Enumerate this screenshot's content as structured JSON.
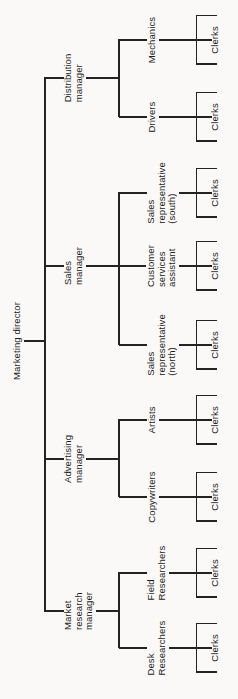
{
  "page": {
    "background_color": "#faf9f7",
    "ink_color": "#232323"
  },
  "chart": {
    "type": "org-tree",
    "root": "Marketing director",
    "branches": [
      {
        "manager": "Market\nresearch\nmanager",
        "children": [
          {
            "role": "Desk\nResearchers",
            "sub": "Clerks"
          },
          {
            "role": "Field\nResearchers",
            "sub": "Clerks"
          }
        ]
      },
      {
        "manager": "Advertising\nmanager",
        "children": [
          {
            "role": "Copywriters",
            "sub": "Clerks"
          },
          {
            "role": "Artists",
            "sub": "Clerks"
          }
        ]
      },
      {
        "manager": "Sales\nmanager",
        "children": [
          {
            "role": "Sales\nrepresentative\n(north)",
            "sub": "Clerks"
          },
          {
            "role": "Customer\nservices\nassistant",
            "sub": "Clerks"
          },
          {
            "role": "Sales\nrepresentative\n(south)",
            "sub": "Clerks"
          }
        ]
      },
      {
        "manager": "Distribution\nmanager",
        "children": [
          {
            "role": "Drivers",
            "sub": "Clerks"
          },
          {
            "role": "Mechanics",
            "sub": "Clerks"
          }
        ]
      }
    ]
  }
}
